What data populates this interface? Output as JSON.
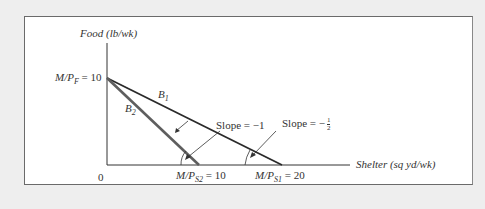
{
  "axes": {
    "y_label": "Food (lb/wk)",
    "x_label": "Shelter (sq yd/wk)",
    "origin": "0"
  },
  "intercepts": {
    "food": {
      "prefix": "M/P",
      "sub": "F",
      "value": "= 10"
    },
    "shelter_2": {
      "prefix": "M/P",
      "sub": "S2",
      "value": "= 10"
    },
    "shelter_1": {
      "prefix": "M/P",
      "sub": "S1",
      "value": "= 20"
    }
  },
  "lines": {
    "b1": {
      "label": "B",
      "sub": "1"
    },
    "b2": {
      "label": "B",
      "sub": "2"
    }
  },
  "annotations": {
    "slope_b2": "Slope = −1",
    "slope_b1_prefix": "Slope = −",
    "slope_b1_num": "1",
    "slope_b1_den": "2"
  },
  "colors": {
    "b1": "#2a2a2a",
    "b2": "#5a5a5a",
    "axis": "#333333"
  }
}
